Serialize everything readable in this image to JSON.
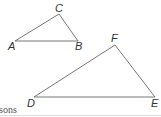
{
  "diagram": {
    "triangles": [
      {
        "name": "ABC",
        "vertices": [
          {
            "label": "A"
          },
          {
            "label": "B"
          },
          {
            "label": "C"
          }
        ]
      },
      {
        "name": "DEF",
        "vertices": [
          {
            "label": "D"
          },
          {
            "label": "E"
          },
          {
            "label": "F"
          }
        ]
      }
    ],
    "footer_text": "sons",
    "line_color": "#666666"
  }
}
